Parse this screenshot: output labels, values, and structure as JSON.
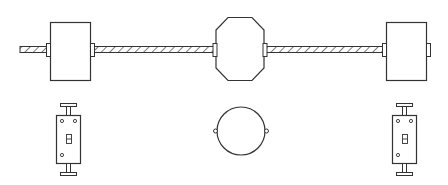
{
  "diagram": {
    "title": "",
    "stroke_color": "#333333",
    "background": "#ffffff",
    "cable": {
      "label": "armored-cable",
      "x_start": 20,
      "x_end": 448,
      "y": 50
    },
    "boxes": [
      {
        "id": "left-switch-box",
        "shape": "rectangle"
      },
      {
        "id": "center-junction-box",
        "shape": "octagon"
      },
      {
        "id": "right-switch-box",
        "shape": "rectangle"
      }
    ],
    "devices": [
      {
        "id": "left-toggle-switch",
        "type": "single-pole-switch"
      },
      {
        "id": "center-box-cover",
        "type": "round-blank-cover"
      },
      {
        "id": "right-toggle-switch",
        "type": "single-pole-switch"
      }
    ]
  }
}
